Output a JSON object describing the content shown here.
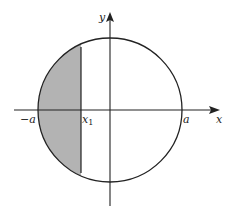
{
  "diagram": {
    "labels": {
      "y_axis": "y",
      "x_axis": "x",
      "neg_a": "−a",
      "x1_base": "x",
      "x1_sub": "1",
      "a": "a"
    },
    "colors": {
      "stroke": "#222222",
      "shade": "#b3b3b3",
      "background": "#ffffff"
    }
  }
}
